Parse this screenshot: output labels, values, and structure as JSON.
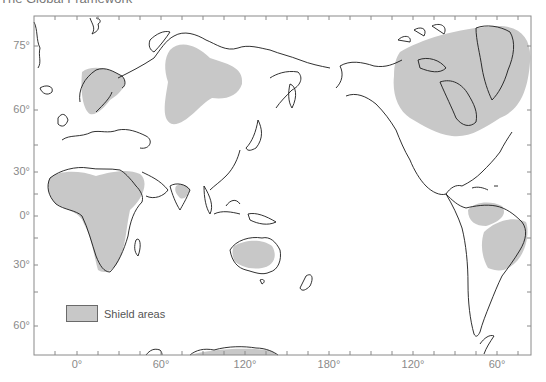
{
  "page": {
    "title": "The Global Framework"
  },
  "map": {
    "projection": "world map centered on Pacific (180°), longitudes 0° to 60°W shown twice",
    "frame_color": "#8a8a8a",
    "coast_color": "#1a1a1a",
    "shield_fill": "#c8c8c8",
    "latitude_labels": [
      {
        "label": "75°",
        "y": 46
      },
      {
        "label": "60°",
        "y": 110
      },
      {
        "label": "30°",
        "y": 172
      },
      {
        "label": "0°",
        "y": 216
      },
      {
        "label": "30°",
        "y": 265
      },
      {
        "label": "60°",
        "y": 326
      }
    ],
    "longitude_labels": [
      {
        "label": "0°",
        "x": 77
      },
      {
        "label": "60°",
        "x": 161
      },
      {
        "label": "120°",
        "x": 245
      },
      {
        "label": "180°",
        "x": 329
      },
      {
        "label": "120°",
        "x": 413
      },
      {
        "label": "60°",
        "x": 497
      }
    ]
  },
  "legend": {
    "items": [
      {
        "label": "Shield areas",
        "color": "#c8c8c8"
      }
    ]
  },
  "shield_areas": [
    "Canadian Shield (with Greenland)",
    "Baltic Shield (Scandinavia)",
    "Siberian (Angara) Shield",
    "African Shield",
    "Arabian Shield",
    "Indian Shield",
    "Australian Shield",
    "Guiana Shield",
    "Brazilian Shield",
    "Antarctic Shield"
  ]
}
